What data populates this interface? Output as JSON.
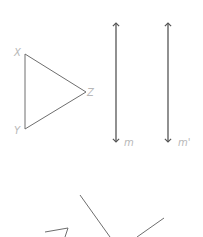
{
  "diagram": {
    "triangle": {
      "vertices": {
        "X": {
          "label": "X",
          "x": 25,
          "y": 54
        },
        "Y": {
          "label": "Y",
          "x": 25,
          "y": 129
        },
        "Z": {
          "label": "Z",
          "x": 86,
          "y": 92
        }
      }
    },
    "lines": [
      {
        "label": "m",
        "x": 116,
        "y1": 22,
        "y2": 143
      },
      {
        "label": "m'",
        "x": 168,
        "y1": 22,
        "y2": 143
      }
    ],
    "fragments": "partial triangle and two line segments cut off at bottom edge",
    "colors": {
      "stroke": "#6e6e6e",
      "label": "#b8b8b8"
    }
  }
}
